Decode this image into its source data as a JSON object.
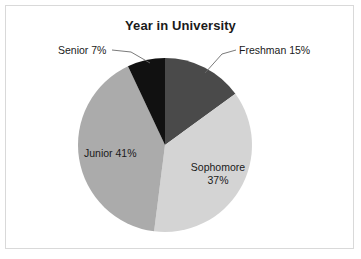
{
  "chart_data": {
    "type": "pie",
    "title": "Year in University",
    "categories": [
      "Freshman",
      "Sophomore",
      "Junior",
      "Senior"
    ],
    "values": [
      15,
      37,
      41,
      7
    ],
    "unit": "%",
    "legend": "none",
    "grid": false,
    "slices": [
      {
        "name": "Freshman",
        "value": 15,
        "label": "Freshman 15%",
        "color": "#4a4a4a",
        "label_position": "outside",
        "leader_line": true
      },
      {
        "name": "Sophomore",
        "value": 37,
        "label": "Sophomore 37%",
        "label_line1": "Sophomore",
        "label_line2": "37%",
        "color": "#d4d4d4",
        "label_position": "inside",
        "leader_line": false
      },
      {
        "name": "Junior",
        "value": 41,
        "label": "Junior 41%",
        "color": "#ababab",
        "label_position": "inside",
        "leader_line": false
      },
      {
        "name": "Senior",
        "value": 7,
        "label": "Senior 7%",
        "color": "#111111",
        "label_position": "outside",
        "leader_line": true
      }
    ]
  },
  "chart": {
    "title": "Year in University",
    "geometry": {
      "center_x": 165,
      "center_y": 145,
      "radius": 87,
      "start_angle_deg": -90
    },
    "frame_color": "#d9d9d9",
    "background": "#ffffff",
    "labels": {
      "senior": "Senior 7%",
      "freshman": "Freshman 15%",
      "junior": "Junior 41%",
      "sophomore_line1": "Sophomore",
      "sophomore_line2": "37%"
    }
  }
}
